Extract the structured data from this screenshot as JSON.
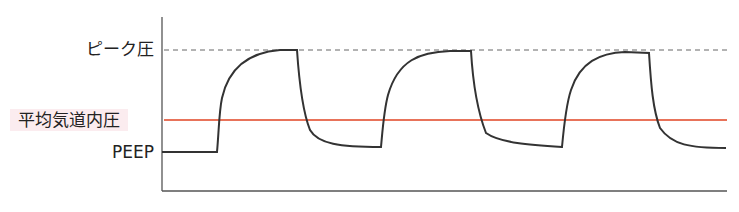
{
  "diagram": {
    "title": "",
    "labels": {
      "peak_pressure": "ピーク圧",
      "mean_airway_pressure": "平均気道内圧",
      "peep": "PEEP"
    },
    "colors": {
      "waveform": "#333333",
      "mean_line": "#e8735a",
      "peak_line": "#666666",
      "axis": "#555555",
      "mean_label_bg": "#fbecef"
    },
    "cycles": 3
  }
}
